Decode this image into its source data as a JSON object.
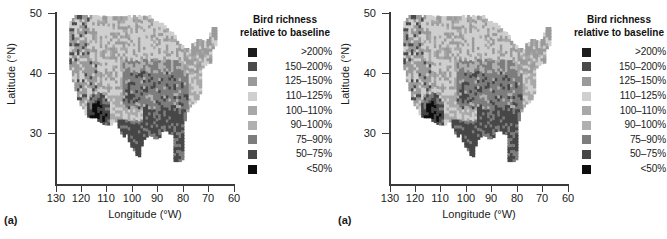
{
  "figure": {
    "panels": [
      {
        "tag": "(a)",
        "axes": {
          "xlabel": "Longitude (°W)",
          "ylabel": "Latitude (°N)",
          "xticks": [
            "130",
            "120",
            "110",
            "100",
            "90",
            "80",
            "70",
            "60"
          ],
          "yticks": [
            "30",
            "40",
            "50"
          ]
        },
        "legend": {
          "title_line1": "Bird richness",
          "title_line2": "relative to baseline",
          "entries": [
            {
              "label": ">200%",
              "color": "#1c1c1c"
            },
            {
              "label": "150–200%",
              "color": "#4a4a4a"
            },
            {
              "label": "125–150%",
              "color": "#9a9a9a"
            },
            {
              "label": "110–125%",
              "color": "#cfcfcf"
            },
            {
              "label": "100–110%",
              "color": "#a8a8a8"
            },
            {
              "label": "90–100%",
              "color": "#b0b0b0"
            },
            {
              "label": "75–90%",
              "color": "#7d7d7d"
            },
            {
              "label": "50–75%",
              "color": "#474747"
            },
            {
              "label": "<50%",
              "color": "#0d0d0d"
            }
          ]
        }
      },
      {
        "tag": "(a)",
        "axes": {
          "xlabel": "Longitude (°W)",
          "ylabel": "Latitude (°N)",
          "xticks": [
            "130",
            "120",
            "110",
            "100",
            "90",
            "80",
            "70",
            "60"
          ],
          "yticks": [
            "30",
            "40",
            "50"
          ]
        },
        "legend": {
          "title_line1": "Bird richness",
          "title_line2": "relative to baseline",
          "entries": [
            {
              "label": ">200%",
              "color": "#1c1c1c"
            },
            {
              "label": "150–200%",
              "color": "#4a4a4a"
            },
            {
              "label": "125–150%",
              "color": "#9a9a9a"
            },
            {
              "label": "110–125%",
              "color": "#cfcfcf"
            },
            {
              "label": "100–110%",
              "color": "#a8a8a8"
            },
            {
              "label": "90–100%",
              "color": "#b0b0b0"
            },
            {
              "label": "75–90%",
              "color": "#7d7d7d"
            },
            {
              "label": "50–75%",
              "color": "#474747"
            },
            {
              "label": "<50%",
              "color": "#0d0d0d"
            }
          ]
        }
      }
    ]
  },
  "chart_data": [
    {
      "type": "heatmap",
      "title": "Bird richness relative to baseline",
      "panel": "(a)",
      "xlabel": "Longitude (°W)",
      "ylabel": "Latitude (°N)",
      "xlim": [
        130,
        60
      ],
      "ylim": [
        24,
        50
      ],
      "xticks": [
        130,
        120,
        110,
        100,
        90,
        80,
        70,
        60
      ],
      "yticks": [
        30,
        40,
        50
      ],
      "grid": false,
      "legend_position": "right",
      "colorbar_classes": [
        {
          "label": ">200%",
          "color": "#1c1c1c",
          "min": 200,
          "max": null
        },
        {
          "label": "150-200%",
          "color": "#4a4a4a",
          "min": 150,
          "max": 200
        },
        {
          "label": "125-150%",
          "color": "#9a9a9a",
          "min": 125,
          "max": 150
        },
        {
          "label": "110-125%",
          "color": "#cfcfcf",
          "min": 110,
          "max": 125
        },
        {
          "label": "100-110%",
          "color": "#a8a8a8",
          "min": 100,
          "max": 110
        },
        {
          "label": "90-100%",
          "color": "#b0b0b0",
          "min": 90,
          "max": 100
        },
        {
          "label": "75-90%",
          "color": "#7d7d7d",
          "min": 75,
          "max": 90
        },
        {
          "label": "50-75%",
          "color": "#474747",
          "min": 50,
          "max": 75
        },
        {
          "label": "<50%",
          "color": "#0d0d0d",
          "min": null,
          "max": 50
        }
      ],
      "regions": [
        {
          "name": "northern-plains-upper-midwest",
          "lon_range": [
            105,
            90
          ],
          "lat_range": [
            42,
            49
          ],
          "class": "110-125%"
        },
        {
          "name": "pacific-northwest",
          "lon_range": [
            125,
            116
          ],
          "lat_range": [
            42,
            49
          ],
          "class": "125-150%"
        },
        {
          "name": "northern-rockies",
          "lon_range": [
            116,
            105
          ],
          "lat_range": [
            42,
            49
          ],
          "class": "110-125%"
        },
        {
          "name": "great-lakes",
          "lon_range": [
            92,
            82
          ],
          "lat_range": [
            41,
            48
          ],
          "class": "110-125%"
        },
        {
          "name": "northeast-new-england",
          "lon_range": [
            80,
            67
          ],
          "lat_range": [
            41,
            47
          ],
          "class": "125-150%"
        },
        {
          "name": "great-basin",
          "lon_range": [
            120,
            111
          ],
          "lat_range": [
            36,
            42
          ],
          "class": "125-150%"
        },
        {
          "name": "california-central",
          "lon_range": [
            124,
            118
          ],
          "lat_range": [
            34,
            42
          ],
          "class": "125-150%"
        },
        {
          "name": "southwest-desert-hotspot",
          "lon_range": [
            116,
            110
          ],
          "lat_range": [
            31,
            35
          ],
          "class": "<50%"
        },
        {
          "name": "central-plains",
          "lon_range": [
            104,
            92
          ],
          "lat_range": [
            33,
            42
          ],
          "class": "75-90%"
        },
        {
          "name": "southern-plains-texas",
          "lon_range": [
            104,
            94
          ],
          "lat_range": [
            26,
            35
          ],
          "class": "50-75%"
        },
        {
          "name": "southeast-gulf",
          "lon_range": [
            92,
            80
          ],
          "lat_range": [
            25,
            35
          ],
          "class": "50-75%"
        },
        {
          "name": "mid-atlantic-appalachia",
          "lon_range": [
            85,
            75
          ],
          "lat_range": [
            35,
            41
          ],
          "class": "75-90%"
        },
        {
          "name": "florida-peninsula",
          "lon_range": [
            83,
            80
          ],
          "lat_range": [
            25,
            31
          ],
          "class": "50-75%"
        }
      ]
    },
    {
      "type": "heatmap",
      "title": "Bird richness relative to baseline",
      "panel": "(a)",
      "xlabel": "Longitude (°W)",
      "ylabel": "Latitude (°N)",
      "xlim": [
        130,
        60
      ],
      "ylim": [
        24,
        50
      ],
      "xticks": [
        130,
        120,
        110,
        100,
        90,
        80,
        70,
        60
      ],
      "yticks": [
        30,
        40,
        50
      ],
      "grid": false,
      "legend_position": "right",
      "colorbar_classes": [
        {
          "label": ">200%",
          "color": "#1c1c1c",
          "min": 200,
          "max": null
        },
        {
          "label": "150-200%",
          "color": "#4a4a4a",
          "min": 150,
          "max": 200
        },
        {
          "label": "125-150%",
          "color": "#9a9a9a",
          "min": 125,
          "max": 150
        },
        {
          "label": "110-125%",
          "color": "#cfcfcf",
          "min": 110,
          "max": 125
        },
        {
          "label": "100-110%",
          "color": "#a8a8a8",
          "min": 100,
          "max": 110
        },
        {
          "label": "90-100%",
          "color": "#b0b0b0",
          "min": 90,
          "max": 100
        },
        {
          "label": "75-90%",
          "color": "#7d7d7d",
          "min": 75,
          "max": 90
        },
        {
          "label": "50-75%",
          "color": "#474747",
          "min": 50,
          "max": 75
        },
        {
          "label": "<50%",
          "color": "#0d0d0d",
          "min": null,
          "max": 50
        }
      ],
      "regions": [
        {
          "name": "northern-plains-upper-midwest",
          "lon_range": [
            105,
            90
          ],
          "lat_range": [
            42,
            49
          ],
          "class": "110-125%"
        },
        {
          "name": "pacific-northwest",
          "lon_range": [
            125,
            116
          ],
          "lat_range": [
            42,
            49
          ],
          "class": "125-150%"
        },
        {
          "name": "northern-rockies",
          "lon_range": [
            116,
            105
          ],
          "lat_range": [
            42,
            49
          ],
          "class": "110-125%"
        },
        {
          "name": "great-lakes",
          "lon_range": [
            92,
            82
          ],
          "lat_range": [
            41,
            48
          ],
          "class": "110-125%"
        },
        {
          "name": "northeast-new-england",
          "lon_range": [
            80,
            67
          ],
          "lat_range": [
            41,
            47
          ],
          "class": "125-150%"
        },
        {
          "name": "great-basin",
          "lon_range": [
            120,
            111
          ],
          "lat_range": [
            36,
            42
          ],
          "class": "125-150%"
        },
        {
          "name": "california-central",
          "lon_range": [
            124,
            118
          ],
          "lat_range": [
            34,
            42
          ],
          "class": "125-150%"
        },
        {
          "name": "southwest-desert-hotspot",
          "lon_range": [
            116,
            110
          ],
          "lat_range": [
            31,
            35
          ],
          "class": "<50%"
        },
        {
          "name": "central-plains",
          "lon_range": [
            104,
            92
          ],
          "lat_range": [
            33,
            42
          ],
          "class": "75-90%"
        },
        {
          "name": "southern-plains-texas",
          "lon_range": [
            104,
            94
          ],
          "lat_range": [
            26,
            35
          ],
          "class": "50-75%"
        },
        {
          "name": "southeast-gulf",
          "lon_range": [
            92,
            80
          ],
          "lat_range": [
            25,
            35
          ],
          "class": "50-75%"
        },
        {
          "name": "mid-atlantic-appalachia",
          "lon_range": [
            85,
            75
          ],
          "lat_range": [
            35,
            41
          ],
          "class": "75-90%"
        },
        {
          "name": "florida-peninsula",
          "lon_range": [
            83,
            80
          ],
          "lat_range": [
            25,
            31
          ],
          "class": "50-75%"
        }
      ]
    }
  ]
}
